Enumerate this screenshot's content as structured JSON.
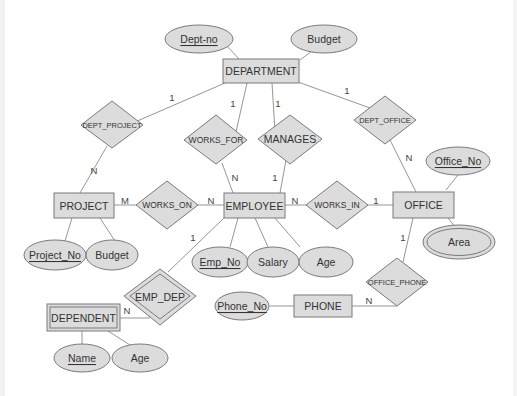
{
  "diagram": {
    "type": "ER diagram",
    "entities": [
      {
        "id": "department",
        "label": "DEPARTMENT",
        "weak": false
      },
      {
        "id": "project",
        "label": "PROJECT",
        "weak": false
      },
      {
        "id": "employee",
        "label": "EMPLOYEE",
        "weak": false
      },
      {
        "id": "office",
        "label": "OFFICE",
        "weak": false
      },
      {
        "id": "phone",
        "label": "PHONE",
        "weak": false
      },
      {
        "id": "dependent",
        "label": "DEPENDENT",
        "weak": true
      }
    ],
    "relationships": [
      {
        "id": "dept_project",
        "label": "DEPT_PROJECT",
        "identifying": false
      },
      {
        "id": "works_for",
        "label": "WORKS_FOR",
        "identifying": false
      },
      {
        "id": "manages",
        "label": "MANAGES",
        "identifying": false
      },
      {
        "id": "dept_office",
        "label": "DEPT_OFFICE",
        "identifying": false
      },
      {
        "id": "works_on",
        "label": "WORKS_ON",
        "identifying": false
      },
      {
        "id": "works_in",
        "label": "WORKS_IN",
        "identifying": false
      },
      {
        "id": "office_phone",
        "label": "OFFICE_PHONE",
        "identifying": false
      },
      {
        "id": "emp_dep",
        "label": "EMP_DEP",
        "identifying": true
      }
    ],
    "attributes": [
      {
        "id": "dept_no",
        "label": "Dept-no",
        "of": "DEPARTMENT",
        "key": true
      },
      {
        "id": "dept_budget",
        "label": "Budget",
        "of": "DEPARTMENT",
        "key": false
      },
      {
        "id": "project_no",
        "label": "Project_No",
        "of": "PROJECT",
        "key": true
      },
      {
        "id": "project_budget",
        "label": "Budget",
        "of": "PROJECT",
        "key": false
      },
      {
        "id": "emp_no",
        "label": "Emp_No",
        "of": "EMPLOYEE",
        "key": true
      },
      {
        "id": "salary",
        "label": "Salary",
        "of": "EMPLOYEE",
        "key": false
      },
      {
        "id": "emp_age",
        "label": "Age",
        "of": "EMPLOYEE",
        "key": false
      },
      {
        "id": "office_no",
        "label": "Office_No",
        "of": "OFFICE",
        "key": true
      },
      {
        "id": "area",
        "label": "Area",
        "of": "OFFICE",
        "key": false,
        "multivalued": true
      },
      {
        "id": "phone_no",
        "label": "Phone_No",
        "of": "PHONE",
        "key": true
      },
      {
        "id": "dep_name",
        "label": "Name",
        "of": "DEPENDENT",
        "key": true
      },
      {
        "id": "dep_age",
        "label": "Age",
        "of": "DEPENDENT",
        "key": false
      }
    ],
    "cardinalities": {
      "department_dept_project": "1",
      "dept_project_project": "N",
      "department_works_for": "1",
      "works_for_employee": "N",
      "department_manages": "1",
      "manages_employee": "1",
      "department_dept_office": "1",
      "dept_office_office": "N",
      "project_works_on": "M",
      "works_on_employee": "N",
      "employee_works_in": "N",
      "works_in_office": "1",
      "office_office_phone": "1",
      "office_phone_phone": "N",
      "employee_emp_dep": "1",
      "emp_dep_dependent": "N"
    },
    "colors": {
      "shape_fill": "#dcdcdc",
      "stroke": "#7a7a7a",
      "text": "#333333",
      "background": "#ffffff"
    }
  }
}
